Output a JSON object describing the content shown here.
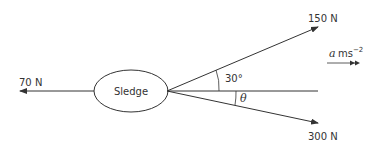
{
  "diagram": {
    "object_label": "Sledge",
    "forces": [
      {
        "label": "70 N",
        "direction": "left"
      },
      {
        "label": "150 N",
        "angle_label": "30°",
        "direction": "up-right"
      },
      {
        "label": "300 N",
        "angle_label": "θ",
        "direction": "down-right"
      }
    ],
    "acceleration": {
      "symbol": "a",
      "unit": "ms",
      "exponent": "−2"
    },
    "colors": {
      "line": "#333333",
      "background": "#ffffff"
    }
  }
}
